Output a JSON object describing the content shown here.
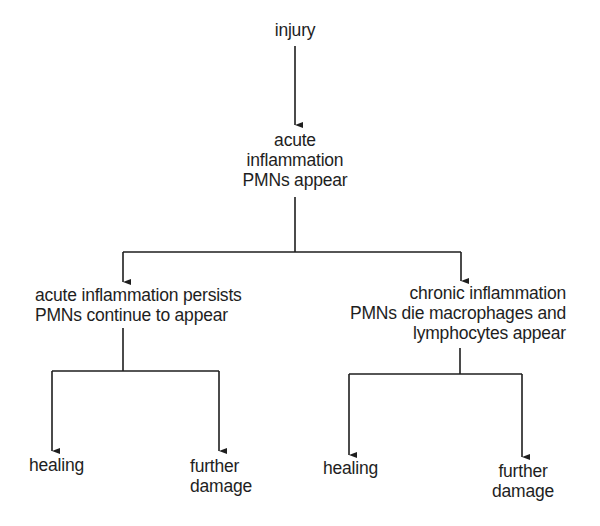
{
  "diagram": {
    "type": "flowchart",
    "nodes": {
      "injury": {
        "lines": [
          "injury"
        ]
      },
      "acute": {
        "lines": [
          "acute",
          "inflammation",
          "PMNs appear"
        ]
      },
      "persist": {
        "lines": [
          "acute inflammation persists",
          "PMNs continue to appear"
        ]
      },
      "chronic": {
        "lines": [
          "chronic inflammation",
          "PMNs die macrophages and",
          "lymphocytes appear"
        ]
      },
      "healing_left": {
        "lines": [
          "healing"
        ]
      },
      "damage_left": {
        "lines": [
          "further",
          "damage"
        ]
      },
      "healing_right": {
        "lines": [
          "healing"
        ]
      },
      "damage_right": {
        "lines": [
          "further",
          "damage"
        ]
      }
    },
    "edges": [
      [
        "injury",
        "acute"
      ],
      [
        "acute",
        "persist"
      ],
      [
        "acute",
        "chronic"
      ],
      [
        "persist",
        "healing_left"
      ],
      [
        "persist",
        "damage_left"
      ],
      [
        "chronic",
        "healing_right"
      ],
      [
        "chronic",
        "damage_right"
      ]
    ],
    "colors": {
      "line": "#1e1e1e",
      "text": "#1e1e1e",
      "background": "#ffffff"
    }
  }
}
